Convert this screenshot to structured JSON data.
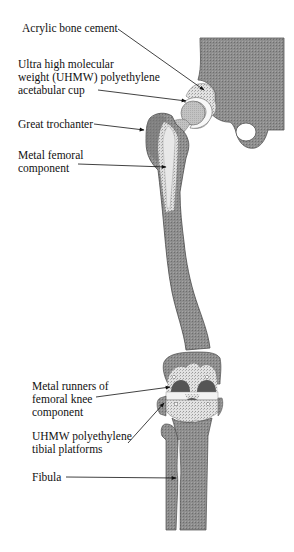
{
  "diagram": {
    "type": "anatomical-implant-illustration",
    "labels": [
      {
        "id": "acrylic-bone-cement",
        "text": "Acrylic bone cement",
        "x": 22,
        "y": 22
      },
      {
        "id": "uhmw-acetabular-cup",
        "text": "Ultra high molecular\nweight (UHMW) polyethylene\nacetabular cup",
        "x": 18,
        "y": 58
      },
      {
        "id": "great-trochanter",
        "text": "Great trochanter",
        "x": 18,
        "y": 120
      },
      {
        "id": "metal-femoral-component",
        "text": "Metal femoral\ncomponent",
        "x": 18,
        "y": 149
      },
      {
        "id": "metal-runners-femoral-knee",
        "text": "Metal runners of\nfemoral knee\ncomponent",
        "x": 32,
        "y": 378
      },
      {
        "id": "uhmw-tibial-platforms",
        "text": "UHMW polyethylene\ntibial platforms",
        "x": 32,
        "y": 430
      },
      {
        "id": "fibula",
        "text": "Fibula",
        "x": 32,
        "y": 473
      }
    ],
    "colors": {
      "bone": "#8a8a8a",
      "bone_dark": "#707070",
      "cement": "#d4d4d4",
      "polyethylene": "#f4f4f4",
      "metal": "#bdbdbd",
      "metal_dark": "#555555",
      "outline": "#3a3a3a",
      "text": "#111111"
    }
  }
}
